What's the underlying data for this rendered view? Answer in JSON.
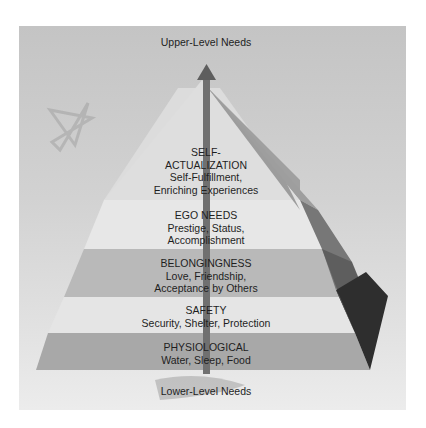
{
  "diagram": {
    "title_top": "Upper-Level Needs",
    "title_bottom": "Lower-Level Needs",
    "levels": [
      {
        "name": "SELF-\nACTUALIZATION",
        "line1": "SELF-",
        "line2": "ACTUALIZATION",
        "desc1": "Self-Fulfillment,",
        "desc2": "Enriching Experiences",
        "color": "#dcdcdc"
      },
      {
        "name": "EGO NEEDS",
        "desc1": "Prestige, Status,",
        "desc2": "Accomplishment",
        "color": "#e6e6e6"
      },
      {
        "name": "BELONGINGNESS",
        "desc1": "Love, Friendship,",
        "desc2": "Acceptance by Others",
        "color": "#b8b8b8"
      },
      {
        "name": "SAFETY",
        "desc1": "Security, Shelter, Protection",
        "color": "#e4e4e4"
      },
      {
        "name": "PHYSIOLOGICAL",
        "desc1": "Water, Sleep, Food",
        "color": "#a9a9a9"
      }
    ],
    "colors": {
      "panel": "#cfcfcf",
      "arrow": "#6e6e6e",
      "side_light": "#9a9a9a",
      "side_mid": "#7a7a7a",
      "side_dark": "#4a4a4a",
      "side_darkest": "#2c2c2c"
    }
  }
}
